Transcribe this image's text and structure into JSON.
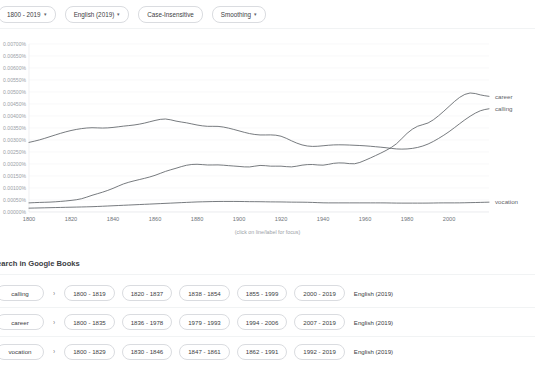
{
  "controls": {
    "date_range": {
      "label": "1800 - 2019",
      "caret": "▾"
    },
    "corpus": {
      "label": "English (2019)",
      "caret": "▾"
    },
    "case": {
      "label": "Case-Insensitive"
    },
    "smoothing": {
      "label": "Smoothing",
      "caret": "▾"
    }
  },
  "chart_data": {
    "type": "line",
    "title": "",
    "xlabel": "",
    "ylabel": "",
    "caption": "(click on line/label for focus)",
    "grid": true,
    "legend_position": "right-inline",
    "xlim": [
      1800,
      2019
    ],
    "ylim": [
      0.0,
      0.007
    ],
    "xticks": [
      1800,
      1820,
      1840,
      1860,
      1880,
      1900,
      1920,
      1940,
      1960,
      1980,
      2000
    ],
    "yticks": [
      "0.00700%",
      "0.00650%",
      "0.00600%",
      "0.00550%",
      "0.00500%",
      "0.00450%",
      "0.00400%",
      "0.00350%",
      "0.00300%",
      "0.00250%",
      "0.00200%",
      "0.00150%",
      "0.00100%",
      "0.00050%",
      "0.00000%"
    ],
    "x": [
      1800,
      1805,
      1810,
      1815,
      1820,
      1825,
      1830,
      1835,
      1840,
      1845,
      1850,
      1855,
      1860,
      1865,
      1870,
      1875,
      1880,
      1885,
      1890,
      1895,
      1900,
      1905,
      1910,
      1915,
      1920,
      1925,
      1930,
      1935,
      1940,
      1945,
      1950,
      1955,
      1960,
      1965,
      1970,
      1975,
      1980,
      1985,
      1990,
      1995,
      2000,
      2005,
      2010,
      2015,
      2019
    ],
    "series": [
      {
        "name": "career",
        "label": "career",
        "color": "#5f6368",
        "values": [
          0.00038,
          0.0004,
          0.00041,
          0.00044,
          0.00048,
          0.00054,
          0.0007,
          0.00082,
          0.00098,
          0.00118,
          0.0013,
          0.0014,
          0.00152,
          0.0017,
          0.00182,
          0.00196,
          0.002,
          0.00195,
          0.00197,
          0.00193,
          0.0019,
          0.00186,
          0.00196,
          0.0019,
          0.00192,
          0.00186,
          0.00196,
          0.00199,
          0.00193,
          0.00204,
          0.00205,
          0.00198,
          0.00215,
          0.00235,
          0.00256,
          0.00282,
          0.0033,
          0.0036,
          0.00368,
          0.004,
          0.0044,
          0.0048,
          0.005,
          0.00487,
          0.00482
        ]
      },
      {
        "name": "calling",
        "label": "calling",
        "color": "#5f6368",
        "values": [
          0.0029,
          0.003,
          0.00314,
          0.00328,
          0.0034,
          0.00348,
          0.00352,
          0.00349,
          0.00352,
          0.00358,
          0.00362,
          0.0037,
          0.00382,
          0.0039,
          0.00378,
          0.00372,
          0.00362,
          0.00356,
          0.00358,
          0.0035,
          0.00338,
          0.00326,
          0.0032,
          0.00322,
          0.00318,
          0.00296,
          0.00278,
          0.00272,
          0.00276,
          0.0028,
          0.0028,
          0.00278,
          0.00276,
          0.00272,
          0.00268,
          0.00262,
          0.00262,
          0.00268,
          0.00282,
          0.00306,
          0.00334,
          0.00368,
          0.004,
          0.00424,
          0.0043
        ]
      },
      {
        "name": "vocation",
        "label": "vocation",
        "color": "#5f6368",
        "values": [
          0.00016,
          0.00017,
          0.00018,
          0.00019,
          0.0002,
          0.00021,
          0.00022,
          0.00024,
          0.00026,
          0.00028,
          0.0003,
          0.00032,
          0.00034,
          0.00036,
          0.00038,
          0.0004,
          0.00042,
          0.00043,
          0.00044,
          0.00044,
          0.00044,
          0.00043,
          0.00043,
          0.00042,
          0.00042,
          0.00041,
          0.00041,
          0.0004,
          0.00038,
          0.00038,
          0.00038,
          0.00038,
          0.00038,
          0.00038,
          0.00038,
          0.00037,
          0.00037,
          0.00037,
          0.00037,
          0.00038,
          0.00038,
          0.00038,
          0.00039,
          0.0004,
          0.00041
        ]
      }
    ]
  },
  "google_books": {
    "heading": "Search in Google Books",
    "arrow_glyph": "›",
    "rows": [
      {
        "term": "calling",
        "ranges": [
          "1800 - 1819",
          "1820 - 1837",
          "1838 - 1854",
          "1855 - 1999",
          "2000 - 2019"
        ],
        "corpus": "English (2019)"
      },
      {
        "term": "career",
        "ranges": [
          "1800 - 1835",
          "1836 - 1978",
          "1979 - 1993",
          "1994 - 2006",
          "2007 - 2019"
        ],
        "corpus": "English (2019)"
      },
      {
        "term": "vocation",
        "ranges": [
          "1800 - 1829",
          "1830 - 1846",
          "1847 - 1861",
          "1862 - 1991",
          "1992 - 2019"
        ],
        "corpus": "English (2019)"
      }
    ]
  }
}
